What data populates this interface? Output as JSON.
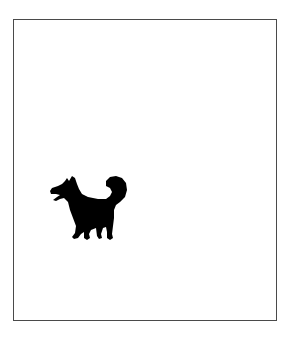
{
  "image": {
    "description": "Black silhouette of a small dog with a curled tail, barking, inside a thin gray rectangular frame",
    "subject": "dog-silhouette",
    "colors": {
      "background": "#ffffff",
      "frame": "#4a4a4a",
      "silhouette": "#000000"
    }
  }
}
